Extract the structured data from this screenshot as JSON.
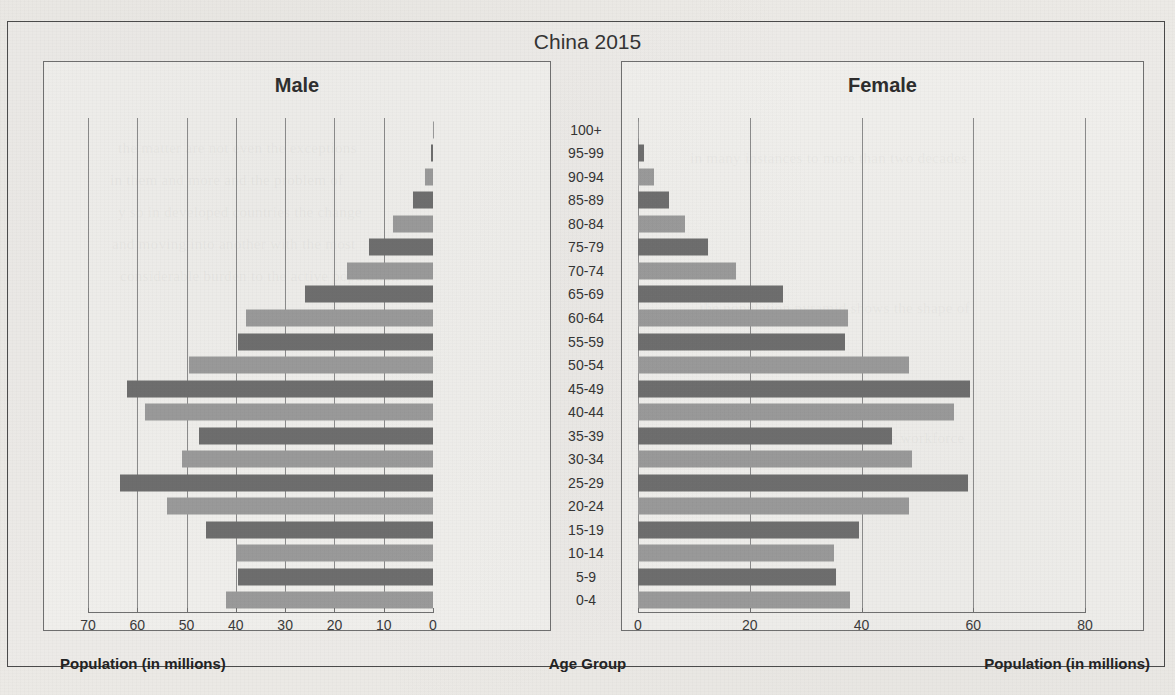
{
  "figure": {
    "title": "China 2015",
    "male_heading": "Male",
    "female_heading": "Female",
    "male_footer": "Population (in millions)",
    "age_footer": "Age Group",
    "female_footer": "Population (in millions)",
    "colors": {
      "bar_dark": "#6d6d6d",
      "bar_light": "#9a9a9a",
      "gridline": "#8b8b8b",
      "frame": "#4a4a4a",
      "panel_border": "#6f6f6f",
      "page_background": "#eceae6"
    }
  },
  "chart_data": {
    "type": "bar",
    "subtype": "population-pyramid",
    "title": "China 2015",
    "xlabel": "Population (in millions)",
    "ylabel": "Age Group",
    "grid": true,
    "legend": "none",
    "categories": [
      "100+",
      "95-99",
      "90-94",
      "85-89",
      "80-84",
      "75-79",
      "70-74",
      "65-69",
      "60-64",
      "55-59",
      "50-54",
      "45-49",
      "40-44",
      "35-39",
      "30-34",
      "25-29",
      "20-24",
      "15-19",
      "10-14",
      "5-9",
      "0-4"
    ],
    "male": {
      "label": "Male",
      "axis_direction": "right-to-left",
      "xlim": [
        0,
        70
      ],
      "xticks": [
        70,
        60,
        50,
        40,
        30,
        20,
        10,
        0
      ],
      "values": [
        0.1,
        0.5,
        1.6,
        4.0,
        8.2,
        13.0,
        17.5,
        26.0,
        38.0,
        39.5,
        49.5,
        62.0,
        58.5,
        47.5,
        51.0,
        63.5,
        54.0,
        46.0,
        40.0,
        39.5,
        42.0
      ]
    },
    "female": {
      "label": "Female",
      "axis_direction": "left-to-right",
      "xlim": [
        0,
        80
      ],
      "xticks": [
        0,
        20,
        40,
        60,
        80
      ],
      "values": [
        0.2,
        1.0,
        2.8,
        5.5,
        8.5,
        12.5,
        17.5,
        26.0,
        37.5,
        37.0,
        48.5,
        59.5,
        56.5,
        45.5,
        49.0,
        59.0,
        48.5,
        39.5,
        35.0,
        35.5,
        38.0
      ]
    }
  },
  "male_axis_ticks": [
    "70",
    "60",
    "50",
    "40",
    "30",
    "20",
    "10",
    "0"
  ],
  "female_axis_ticks": [
    "0",
    "20",
    "40",
    "60",
    "80"
  ],
  "background_text": {
    "l1": "the matter are not  even the  exceptions",
    "l2": "in them  and  more  and  the  problem of",
    "l3": "y  so  in  developed  countries the  change",
    "l4": "and  moving  into  another   with  the  most",
    "l5": "considerable  burden  to  the  active  population",
    "l6": "in  many  instances   to  more  than  two  decades",
    "l7": "the   population   pyramid   shows   the   shape   of",
    "l8": "a  nation  and  so  the  future  of  its  workforce"
  }
}
